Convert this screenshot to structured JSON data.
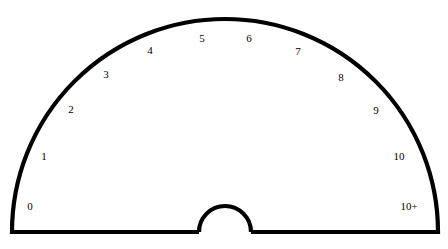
{
  "figure": {
    "type": "radial-sector-dial",
    "background_color": "#ffffff",
    "outline_color": "#000000",
    "divider_color": "#8d8d8d",
    "label_color": "#000000"
  },
  "chart_data": {
    "type": "pie",
    "title": "",
    "subtitle": "",
    "xlabel": "",
    "ylabel": "",
    "legend_position": "none",
    "grid": false,
    "orientation": "semicircle",
    "start_angle_deg": 180,
    "end_angle_deg": 0,
    "sector_count": 12,
    "sector_span_deg": 15,
    "center_x": 225,
    "center_y": 232,
    "outer_radius": 213,
    "inner_radius": 26,
    "categories": [
      "0",
      "1",
      "2",
      "3",
      "4",
      "5",
      "6",
      "7",
      "8",
      "9",
      "10",
      "10+"
    ],
    "values": [
      1,
      1,
      1,
      1,
      1,
      1,
      1,
      1,
      1,
      1,
      1,
      1
    ],
    "sectors": [
      {
        "label": "0",
        "index": 0,
        "start_deg": 180,
        "end_deg": 165,
        "label_x": 30,
        "label_y": 207
      },
      {
        "label": "1",
        "index": 1,
        "start_deg": 165,
        "end_deg": 150,
        "label_x": 44,
        "label_y": 157
      },
      {
        "label": "2",
        "index": 2,
        "start_deg": 150,
        "end_deg": 135,
        "label_x": 71,
        "label_y": 110
      },
      {
        "label": "3",
        "index": 3,
        "start_deg": 135,
        "end_deg": 120,
        "label_x": 106,
        "label_y": 75
      },
      {
        "label": "4",
        "index": 4,
        "start_deg": 120,
        "end_deg": 105,
        "label_x": 150,
        "label_y": 51
      },
      {
        "label": "5",
        "index": 5,
        "start_deg": 105,
        "end_deg": 90,
        "label_x": 202,
        "label_y": 39
      },
      {
        "label": "6",
        "index": 6,
        "start_deg": 90,
        "end_deg": 75,
        "label_x": 249,
        "label_y": 39
      },
      {
        "label": "7",
        "index": 7,
        "start_deg": 75,
        "end_deg": 60,
        "label_x": 298,
        "label_y": 52
      },
      {
        "label": "8",
        "index": 8,
        "start_deg": 60,
        "end_deg": 45,
        "label_x": 341,
        "label_y": 78
      },
      {
        "label": "9",
        "index": 9,
        "start_deg": 45,
        "end_deg": 30,
        "label_x": 376,
        "label_y": 111
      },
      {
        "label": "10",
        "index": 10,
        "start_deg": 30,
        "end_deg": 15,
        "label_x": 399,
        "label_y": 157
      },
      {
        "label": "10+",
        "index": 11,
        "start_deg": 15,
        "end_deg": 0,
        "label_x": 409,
        "label_y": 207
      }
    ],
    "divider_angles_deg": [
      165,
      150,
      135,
      120,
      105,
      90,
      75,
      60,
      45,
      30,
      15
    ]
  }
}
